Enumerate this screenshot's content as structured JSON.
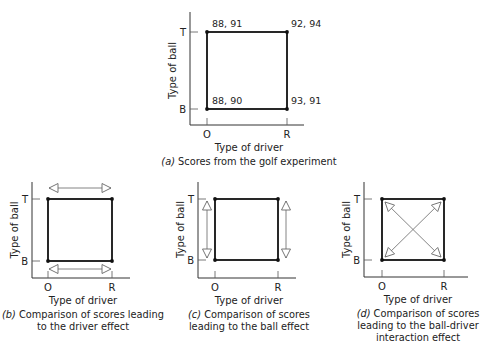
{
  "panels": [
    {
      "id": "a",
      "axis": {
        "x0": 190,
        "yTop": 12,
        "yBase": 125,
        "xEnd": 304
      },
      "square": {
        "left": 207,
        "right": 287,
        "top": 32,
        "bottom": 109
      },
      "y_ticks": [
        "T",
        "B"
      ],
      "x_ticks": [
        "O",
        "R"
      ],
      "y_label": "Type of ball",
      "x_label": "Type of driver",
      "caption_letter": "(a)",
      "caption_lines": [
        "Scores from the golf experiment"
      ],
      "point_labels": {
        "OT": "88, 91",
        "RT": "92, 94",
        "OB": "88, 90",
        "RB": "93, 91"
      },
      "arrows": "none"
    },
    {
      "id": "b",
      "axis": {
        "x0": 32,
        "yTop": 182,
        "yBase": 278,
        "xEnd": 130
      },
      "square": {
        "left": 48,
        "right": 112,
        "top": 199,
        "bottom": 261
      },
      "y_ticks": [
        "T",
        "B"
      ],
      "x_ticks": [
        "O",
        "R"
      ],
      "y_label": "Type of ball",
      "x_label": "Type of driver",
      "caption_letter": "(b)",
      "caption_lines": [
        "Comparison of scores leading",
        "to the driver effect"
      ],
      "arrows": "horizontal"
    },
    {
      "id": "c",
      "axis": {
        "x0": 198,
        "yTop": 182,
        "yBase": 278,
        "xEnd": 296
      },
      "square": {
        "left": 215,
        "right": 278,
        "top": 199,
        "bottom": 260
      },
      "y_ticks": [
        "T",
        "B"
      ],
      "x_ticks": [
        "O",
        "R"
      ],
      "y_label": "Type of ball",
      "x_label": "Type of driver",
      "caption_letter": "(c)",
      "caption_lines": [
        "Comparison of scores",
        "leading to the ball effect"
      ],
      "arrows": "vertical"
    },
    {
      "id": "d",
      "axis": {
        "x0": 364,
        "yTop": 182,
        "yBase": 277,
        "xEnd": 468
      },
      "square": {
        "left": 382,
        "right": 444,
        "top": 199,
        "bottom": 260
      },
      "y_ticks": [
        "T",
        "B"
      ],
      "x_ticks": [
        "O",
        "R"
      ],
      "y_label": "Type of ball",
      "x_label": "Type of driver",
      "caption_letter": "(d)",
      "caption_lines": [
        "Comparison of scores",
        "leading to the ball-driver",
        "interaction effect"
      ],
      "arrows": "diagonal"
    }
  ],
  "colors": {
    "line": "#111111",
    "arrow": "#777777",
    "text": "#222222"
  }
}
